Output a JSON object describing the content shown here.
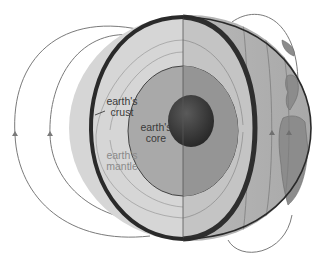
{
  "diagram": {
    "labels": {
      "crust": {
        "line1": "earth's",
        "line2": "crust"
      },
      "core": {
        "line1": "earth's",
        "line2": "core"
      },
      "mantle": {
        "line1": "earth's",
        "line2": "mantle"
      }
    },
    "colors": {
      "background": "#ffffff",
      "mantle_cut": "#d4d4d4",
      "outer_core": "#a9a9a9",
      "inner_core": "#3a3a3a",
      "globe_surface": "#b8b8b8",
      "crust_rim": "#2e2e2e",
      "field_line": "#7a7a7a",
      "continent": "#8c8c8c",
      "label_text_dark": "#3a3a3a",
      "label_text_light": "#8a8a8a"
    },
    "layers": [
      "earth's crust",
      "earth's mantle",
      "earth's core"
    ],
    "field_arrows": "upward"
  }
}
